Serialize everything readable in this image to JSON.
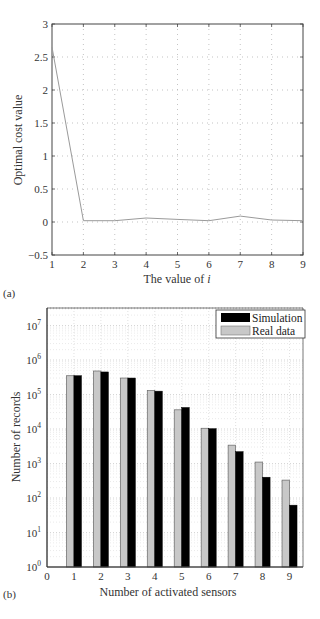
{
  "chart_data": [
    {
      "id": "a",
      "type": "line",
      "panel_label": "(a)",
      "title": "",
      "xlabel": "The value of ",
      "xlabel_italic": "i",
      "ylabel": "Optimal cost value",
      "x": [
        1,
        2,
        3,
        4,
        5,
        6,
        7,
        8,
        9
      ],
      "series": [
        {
          "name": "Optimal cost value",
          "values": [
            2.65,
            0.02,
            0.02,
            0.06,
            0.04,
            0.02,
            0.09,
            0.03,
            0.02
          ],
          "color": "#9a9a9a"
        }
      ],
      "xlim": [
        1,
        9
      ],
      "ylim": [
        -0.5,
        3
      ],
      "xticks": [
        "1",
        "2",
        "3",
        "4",
        "5",
        "6",
        "7",
        "8",
        "9"
      ],
      "yticks": [
        {
          "value": 3,
          "label": "3"
        },
        {
          "value": 2.5,
          "label": "2.5"
        },
        {
          "value": 2,
          "label": "2"
        },
        {
          "value": 1.5,
          "label": "1.5"
        },
        {
          "value": 1,
          "label": "1"
        },
        {
          "value": 0.5,
          "label": "0.5"
        },
        {
          "value": 0,
          "label": "0"
        },
        {
          "value": -0.5,
          "label": "−0.5"
        }
      ],
      "grid": true,
      "legend": null
    },
    {
      "id": "b",
      "type": "bar",
      "panel_label": "(b)",
      "title": "",
      "xlabel": "Number of activated sensors",
      "ylabel": "Number of records",
      "yscale": "log",
      "categories": [
        "1",
        "2",
        "3",
        "4",
        "5",
        "6",
        "7",
        "8",
        "9"
      ],
      "series": [
        {
          "name": "Real data",
          "values": [
            350000,
            480000,
            300000,
            130000,
            36000,
            10500,
            3400,
            1100,
            330
          ],
          "color": "#c8c8c8"
        },
        {
          "name": "Simulation",
          "values": [
            350000,
            450000,
            300000,
            125000,
            42000,
            10200,
            2200,
            400,
            62
          ],
          "color": "#000000"
        }
      ],
      "xlim": [
        0,
        9.5
      ],
      "ylim": [
        1,
        30000000
      ],
      "xticks": [
        "0",
        "1",
        "2",
        "3",
        "4",
        "5",
        "6",
        "7",
        "8",
        "9"
      ],
      "yticks": [
        {
          "exp": 0,
          "base": "10",
          "sup": "0"
        },
        {
          "exp": 1,
          "base": "10",
          "sup": "1"
        },
        {
          "exp": 2,
          "base": "10",
          "sup": "2"
        },
        {
          "exp": 3,
          "base": "10",
          "sup": "3"
        },
        {
          "exp": 4,
          "base": "10",
          "sup": "4"
        },
        {
          "exp": 5,
          "base": "10",
          "sup": "5"
        },
        {
          "exp": 6,
          "base": "10",
          "sup": "6"
        },
        {
          "exp": 7,
          "base": "10",
          "sup": "7"
        }
      ],
      "grid": true,
      "legend": {
        "position": "top-right",
        "entries": [
          {
            "label": "Simulation",
            "color": "#000000"
          },
          {
            "label": "Real data",
            "color": "#c8c8c8"
          }
        ]
      }
    }
  ]
}
